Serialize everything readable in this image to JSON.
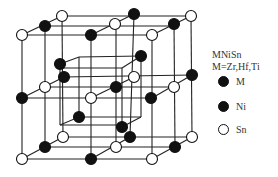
{
  "figure": {
    "title": "MNiSn",
    "subtitle": "M=Zr,Hf,Ti",
    "legend": [
      {
        "label": "M",
        "fill": "#111111"
      },
      {
        "label": "Ni",
        "fill": "#111111"
      },
      {
        "label": "Sn",
        "fill": "#ffffff"
      }
    ]
  },
  "lattice": {
    "line_color": "#222222",
    "atom_stroke": "#111111",
    "atoms": [
      {
        "x": 22,
        "y": 35,
        "type": "Sn"
      },
      {
        "x": 45,
        "y": 26,
        "type": "M"
      },
      {
        "x": 62,
        "y": 16,
        "type": "Sn"
      },
      {
        "x": 134,
        "y": 14,
        "type": "M"
      },
      {
        "x": 115,
        "y": 24,
        "type": "Sn"
      },
      {
        "x": 91,
        "y": 35,
        "type": "M"
      },
      {
        "x": 152,
        "y": 35,
        "type": "Sn"
      },
      {
        "x": 174,
        "y": 24,
        "type": "M"
      },
      {
        "x": 191,
        "y": 16,
        "type": "Sn"
      },
      {
        "x": 22,
        "y": 98,
        "type": "M"
      },
      {
        "x": 45,
        "y": 87,
        "type": "Sn"
      },
      {
        "x": 60,
        "y": 64,
        "type": "Ni"
      },
      {
        "x": 64,
        "y": 77,
        "type": "M"
      },
      {
        "x": 141,
        "y": 56,
        "type": "Ni"
      },
      {
        "x": 134,
        "y": 77,
        "type": "Sn"
      },
      {
        "x": 116,
        "y": 87,
        "type": "M"
      },
      {
        "x": 91,
        "y": 98,
        "type": "Sn"
      },
      {
        "x": 174,
        "y": 87,
        "type": "Sn"
      },
      {
        "x": 151,
        "y": 98,
        "type": "M"
      },
      {
        "x": 192,
        "y": 75,
        "type": "M"
      },
      {
        "x": 79,
        "y": 117,
        "type": "Ni"
      },
      {
        "x": 122,
        "y": 127,
        "type": "Ni"
      },
      {
        "x": 22,
        "y": 159,
        "type": "Sn"
      },
      {
        "x": 45,
        "y": 147,
        "type": "M"
      },
      {
        "x": 63,
        "y": 137,
        "type": "Sn"
      },
      {
        "x": 91,
        "y": 159,
        "type": "M"
      },
      {
        "x": 116,
        "y": 147,
        "type": "Sn"
      },
      {
        "x": 130,
        "y": 137,
        "type": "M"
      },
      {
        "x": 152,
        "y": 159,
        "type": "Sn"
      },
      {
        "x": 175,
        "y": 147,
        "type": "M"
      },
      {
        "x": 192,
        "y": 137,
        "type": "Sn"
      }
    ]
  }
}
